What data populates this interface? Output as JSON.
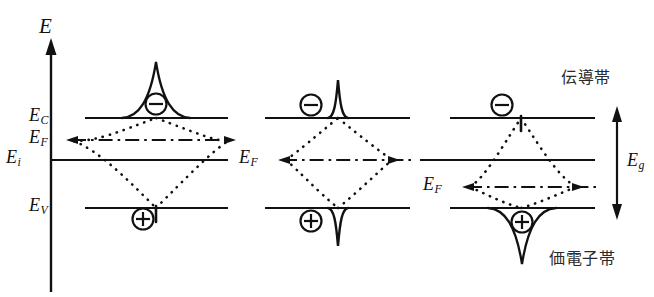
{
  "figure": {
    "type": "semiconductor-band-diagram",
    "axis": {
      "label": "E",
      "orientation": "vertical",
      "arrow": "up"
    },
    "energy_levels": [
      {
        "key": "Ec",
        "symbol": "E",
        "subscript": "C",
        "label": "E_C",
        "y": 118
      },
      {
        "key": "Ef",
        "symbol": "E",
        "subscript": "F",
        "label": "E_F",
        "y": 140
      },
      {
        "key": "Ei",
        "symbol": "E",
        "subscript": "i",
        "label": "E_i",
        "y": 160
      },
      {
        "key": "Ev",
        "symbol": "E",
        "subscript": "V",
        "label": "E_V",
        "y": 208
      }
    ],
    "bandgap": {
      "symbol": "E",
      "subscript": "g",
      "label": "E_g",
      "arrow": "double-headed-vertical",
      "top_y": 110,
      "bottom_y": 216
    },
    "band_names": {
      "conduction": "伝導帯",
      "valence": "価電子帯"
    },
    "carriers": {
      "electron_glyph": "−",
      "hole_glyph": "+",
      "electron_name": "electron-minus-symbol",
      "hole_name": "hole-plus-symbol"
    },
    "panels": [
      {
        "name": "panel-n-type",
        "index": 1,
        "x_start": 85,
        "x_end": 228,
        "fermi_label": "E_F",
        "fermi_label_side": "left-axis",
        "fermi_y": 140,
        "conduction_cusp": "large-upward",
        "valence_cusp": "small-downward"
      },
      {
        "name": "panel-intrinsic",
        "index": 2,
        "x_start": 265,
        "x_end": 410,
        "fermi_label": "E_F",
        "fermi_label_side": "left-inline",
        "fermi_y": 160,
        "conduction_cusp": "narrow-upward",
        "valence_cusp": "narrow-downward"
      },
      {
        "name": "panel-p-type",
        "index": 3,
        "x_start": 450,
        "x_end": 595,
        "fermi_label": "E_F",
        "fermi_label_side": "left-inline",
        "fermi_y": 187,
        "conduction_cusp": "small-upward",
        "valence_cusp": "large-downward"
      }
    ],
    "colors": {
      "ink": "#111111",
      "background": "#ffffff",
      "jp_text": "#2a2a2a"
    }
  }
}
